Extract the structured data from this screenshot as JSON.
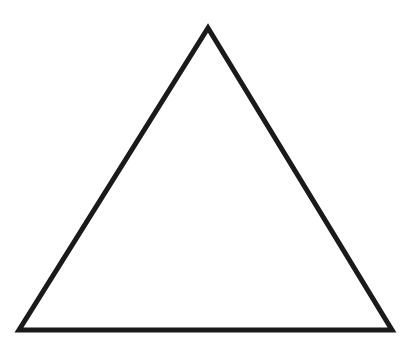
{
  "shape": {
    "type": "triangle",
    "kind": "equilateral-outline",
    "stroke_color": "#1a1a1a",
    "fill_color": "#ffffff",
    "stroke_width": 5,
    "vertices": [
      {
        "name": "apex",
        "x": 208,
        "y": 28
      },
      {
        "name": "bottom-right",
        "x": 392,
        "y": 330
      },
      {
        "name": "bottom-left",
        "x": 19,
        "y": 330
      }
    ]
  },
  "background_color": "#ffffff"
}
